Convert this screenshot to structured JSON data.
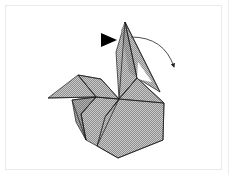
{
  "panel": {
    "background_color": "#ffffff",
    "frame_border_color": "#e9e9e9",
    "page_edge_color": "#ededed"
  },
  "figure": {
    "title": "Origami folding step diagram",
    "paper_fill_color": "#9a9a9a",
    "paper_texture": "checkerboard-halftone",
    "crease_line_color": "#1a1a1a",
    "outline_color": "#1a1a1a",
    "highlight_fill_color": "#ffffff"
  },
  "annotations": {
    "fold_arrow": {
      "name": "curved-fold-arrow",
      "color": "#3a3a3a",
      "start": [
        131,
        37
      ],
      "end": [
        176,
        70
      ],
      "control": [
        164,
        37
      ],
      "direction": "right-down"
    },
    "push_arrow": {
      "name": "solid-triangle-arrow",
      "color": "#000000",
      "points": "101,33 117,40 101,47",
      "direction": "right"
    }
  },
  "shapes": {
    "neck_spike": {
      "name": "neck-spike-panel",
      "points": "125,22 137,78 119,99 116,52"
    },
    "neck_spike_shadow": {
      "name": "neck-spike-shadow-panel",
      "points": "125,22 137,78 128,70 122,30"
    },
    "head_right_wing": {
      "name": "right-wing-panel",
      "points": "137,78 164,103 148,123 119,99"
    },
    "right_upper": {
      "name": "right-upper-panel",
      "points": "125,22 160,92 137,78"
    },
    "body_right": {
      "name": "body-right-panel",
      "points": "119,99 164,103 163,140 118,158 97,146 105,117"
    },
    "body_left": {
      "name": "body-left-panel",
      "points": "119,99 105,117 97,146 86,140 81,114 96,97"
    },
    "tail_upper": {
      "name": "tail-upper-panel",
      "points": "119,99 96,97 78,75 100,79"
    },
    "tail_left_wing": {
      "name": "tail-left-wing-panel",
      "points": "96,97 48,98 78,75"
    },
    "tail_lower": {
      "name": "tail-lower-panel",
      "points": "96,97 81,114 86,140 76,120 72,100"
    },
    "white_notch": {
      "name": "white-notch-gap",
      "points": "139,64 149,80 137,78"
    }
  },
  "creases": [
    {
      "name": "crease-neck-center",
      "d": "M125,22 L119,99"
    },
    {
      "name": "crease-neck-right",
      "d": "M125,22 L137,78"
    },
    {
      "name": "crease-hub-right",
      "d": "M119,99 L164,103"
    },
    {
      "name": "crease-hub-upper-right",
      "d": "M119,99 L137,78"
    },
    {
      "name": "crease-hub-left",
      "d": "M119,99 L96,97"
    },
    {
      "name": "crease-hub-down-left",
      "d": "M119,99 L105,117"
    },
    {
      "name": "crease-hub-down",
      "d": "M119,99 L97,146"
    },
    {
      "name": "crease-tail-spine",
      "d": "M96,97 L78,75"
    },
    {
      "name": "crease-tail-edge",
      "d": "M96,97 L48,98"
    },
    {
      "name": "crease-tail-fold",
      "d": "M96,97 L81,114"
    },
    {
      "name": "crease-body-left-edge",
      "d": "M81,114 L86,140"
    },
    {
      "name": "crease-body-bottom",
      "d": "M97,146 L118,158"
    },
    {
      "name": "crease-body-right-edge",
      "d": "M164,103 L163,140"
    },
    {
      "name": "crease-body-bottom-right",
      "d": "M163,140 L118,158"
    },
    {
      "name": "crease-wing-right",
      "d": "M137,78 L164,103"
    },
    {
      "name": "crease-spike-right-upper",
      "d": "M125,22 L160,92"
    },
    {
      "name": "crease-tail-inner",
      "d": "M78,75 L100,79"
    },
    {
      "name": "crease-tail-inner2",
      "d": "M100,79 L119,99"
    },
    {
      "name": "crease-left-flap",
      "d": "M72,100 L96,97"
    },
    {
      "name": "crease-left-flap-bottom",
      "d": "M72,100 L86,140"
    }
  ]
}
